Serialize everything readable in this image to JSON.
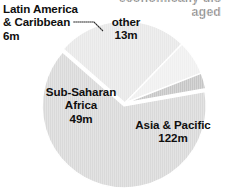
{
  "caption": {
    "text": "economically dis\naged",
    "color": "#9a9a9a",
    "clipped": true
  },
  "labels": {
    "latin_america": "Latin America\n& Caribbean\n6m",
    "other": "other\n13m",
    "sub_saharan_africa": "Sub-Saharan\nAfrica\n49m",
    "asia_pacific": "Asia & Pacific\n122m"
  },
  "chart_data": {
    "type": "pie",
    "title": "",
    "subtitle": "",
    "xlabel": "",
    "ylabel": "",
    "unit": "m",
    "total": 190,
    "legend_position": "none",
    "labels_inline": true,
    "grid": false,
    "categories": [
      "Asia & Pacific",
      "Sub-Saharan Africa",
      "other",
      "Latin America & Caribbean"
    ],
    "values": [
      122,
      49,
      13,
      6
    ],
    "value_labels": [
      "122m",
      "49m",
      "13m",
      "6m"
    ],
    "percentages": [
      64.2,
      25.8,
      6.8,
      3.2
    ],
    "colors": [
      "#d9d9d9",
      "#e8e8e8",
      "#f0f0f0",
      "#c6c6c6"
    ],
    "slice_edge_color": "#ffffff",
    "start_angle_deg": -10,
    "direction": "clockwise",
    "exploded": [
      "Asia & Pacific"
    ],
    "background": "#ffffff"
  },
  "geometry": {
    "center_x": 125,
    "center_y": 103,
    "radius": 82,
    "explode_offset": 3
  }
}
